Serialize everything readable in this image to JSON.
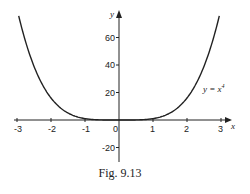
{
  "caption": "Fig. 9.13",
  "chart_data": {
    "type": "line",
    "title": "",
    "xlabel": "x",
    "ylabel": "y",
    "xlim": [
      -3,
      3
    ],
    "ylim": [
      -30,
      70
    ],
    "grid": false,
    "legend": null,
    "x_ticks": [
      -3,
      -2,
      -1,
      0,
      1,
      2,
      3
    ],
    "x_tick_labels": [
      "-3",
      "-2",
      "-1",
      "0",
      "1",
      "2",
      "3"
    ],
    "y_ticks": [
      -20,
      20,
      40,
      60
    ],
    "y_tick_labels": [
      "-20",
      "20",
      "40",
      "60"
    ],
    "annotations": [
      {
        "text": "y = x⁴",
        "x": 2.6,
        "y": 26
      }
    ],
    "series": [
      {
        "name": "y = x^4",
        "function": "x^4",
        "x": [
          -2.95,
          -2.5,
          -2,
          -1.5,
          -1,
          -0.5,
          0,
          0.5,
          1,
          1.5,
          2,
          2.5,
          2.95
        ],
        "values": [
          75.7,
          39.1,
          16,
          5.06,
          1,
          0.06,
          0,
          0.06,
          1,
          5.06,
          16,
          39.1,
          75.7
        ]
      }
    ]
  }
}
